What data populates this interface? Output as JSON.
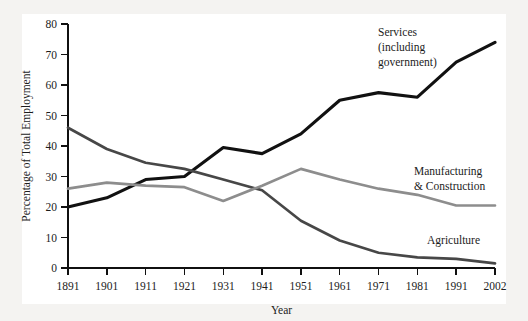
{
  "chart_data": {
    "type": "line",
    "title": "",
    "xlabel": "Year",
    "ylabel": "Percentage of Total Employment",
    "categories": [
      "1891",
      "1901",
      "1911",
      "1921",
      "1931",
      "1941",
      "1951",
      "1961",
      "1971",
      "1981",
      "1991",
      "2002"
    ],
    "x": [
      1891,
      1901,
      1911,
      1921,
      1931,
      1941,
      1951,
      1961,
      1971,
      1981,
      1991,
      2002
    ],
    "xlim": [
      1891,
      2002
    ],
    "ylim": [
      0,
      80
    ],
    "ytick_labels": [
      "0",
      "10",
      "20",
      "30",
      "40",
      "50",
      "60",
      "70",
      "80"
    ],
    "yticks": [
      0,
      10,
      20,
      30,
      40,
      50,
      60,
      70,
      80
    ],
    "grid": false,
    "legend_position": "inline-labels",
    "series": [
      {
        "name": "Services (including government)",
        "label_lines": [
          "Services",
          "(including",
          "government)"
        ],
        "color": "#111111",
        "width": 3.1,
        "values": [
          20,
          23,
          29,
          30,
          39.5,
          37.5,
          44,
          55,
          57.5,
          56,
          67.5,
          74
        ]
      },
      {
        "name": "Agriculture",
        "label_lines": [
          "Agriculture"
        ],
        "color": "#474747",
        "width": 2.7,
        "values": [
          46,
          39,
          34.5,
          32.5,
          29,
          25.5,
          15.5,
          9,
          5,
          3.5,
          3,
          1.5
        ]
      },
      {
        "name": "Manufacturing & Construction",
        "label_lines": [
          "Manufacturing",
          "& Construction"
        ],
        "color": "#8d8d8d",
        "width": 2.7,
        "values": [
          26,
          28,
          27,
          26.5,
          22,
          27,
          32.5,
          29,
          26,
          24,
          20.5,
          20.5
        ]
      }
    ],
    "annotations": [
      {
        "id": "services-label",
        "lines": [
          "Services",
          "(including",
          "government)"
        ],
        "x": 378,
        "y": 36
      },
      {
        "id": "manufacturing-label",
        "lines": [
          "Manufacturing",
          "& Construction"
        ],
        "x": 414,
        "y": 175
      },
      {
        "id": "agriculture-label",
        "lines": [
          "Agriculture"
        ],
        "x": 427,
        "y": 244
      }
    ],
    "colors": {
      "background": "#f4f3f1",
      "plot_background": "#ffffff",
      "axis": "#101010",
      "text": "#1c1c1c"
    }
  }
}
